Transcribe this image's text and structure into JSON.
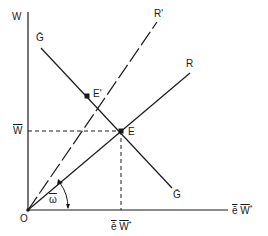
{
  "diagram": {
    "type": "economic-equilibrium",
    "labels": {
      "y_axis": "W",
      "origin": "O",
      "w_bar": "W̄",
      "e_label": "E",
      "e_prime_label": "E'",
      "r_label": "R",
      "r_prime_label": "R'",
      "g_bar_top": "Ḡ",
      "g_bar_bottom": "Ḡ",
      "x_axis_e": "ē",
      "x_axis_w": "W",
      "x_axis_star": "*",
      "tick_e": "ē",
      "tick_w": "W",
      "tick_star": "*",
      "omega": "ω"
    },
    "colors": {
      "line": "#1a1a1a",
      "background": "#ffffff"
    }
  }
}
